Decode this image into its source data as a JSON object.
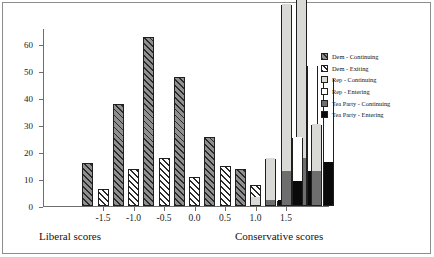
{
  "chart_data": {
    "type": "bar",
    "title": "",
    "subtitle": "",
    "xlabel_left": "Liberal scores",
    "xlabel_right": "Conservative scores",
    "ylabel": "",
    "ylim": [
      0,
      66
    ],
    "yticks": [
      0,
      10,
      20,
      30,
      40,
      50,
      60
    ],
    "ytick_labels": [
      "0",
      "10",
      "20",
      "30",
      "40",
      "50",
      "60"
    ],
    "xticks": [
      -1.5,
      -1.0,
      -0.5,
      0.0,
      0.5,
      1.0,
      1.5
    ],
    "xtick_labels": [
      "-1.5",
      "-1.0",
      "-0.5",
      "0.0",
      "0.5",
      "1.0",
      "1.5"
    ],
    "grid": false,
    "legend_position": "right",
    "stacked": true,
    "categories": [
      "-1.75",
      "-1.5",
      "-1.25",
      "-1.0",
      "-0.75",
      "-0.5",
      "-0.25",
      "0.0",
      "0.25",
      "0.5",
      "0.75",
      "1.0",
      "1.25",
      "1.5",
      "1.75"
    ],
    "series": [
      {
        "name": "Dem - Continuing",
        "color": "#8f8f8f",
        "pattern": "hatch-45-on-gray",
        "bars": [
          {
            "x": "-1.75",
            "value": 16
          },
          {
            "x": "-1.25",
            "value": 37.8
          },
          {
            "x": "-0.75",
            "value": 62.6
          },
          {
            "x": "-0.25",
            "value": 47.8
          },
          {
            "x": "0.25",
            "value": 25.7
          },
          {
            "x": "0.75",
            "value": 13.6
          },
          {
            "x": "1.25",
            "value": 0.8
          },
          {
            "x": "1.75",
            "value": 0.8
          }
        ]
      },
      {
        "name": "Dem - Exiting",
        "color": "#ffffff",
        "pattern": "hatch-45-on-white",
        "bars": [
          {
            "x": "-1.5",
            "value": 6.2
          },
          {
            "x": "-1.0",
            "value": 13.9
          },
          {
            "x": "-0.5",
            "value": 17.9
          },
          {
            "x": "0.0",
            "value": 10.8
          },
          {
            "x": "0.5",
            "value": 14.8
          },
          {
            "x": "1.0",
            "value": 7.7
          },
          {
            "x": "1.5",
            "value": 1.7
          }
        ]
      },
      {
        "name": "Rep - Continuing",
        "color": "#d9d9d6",
        "pattern": "solid-light-gray",
        "bars": [
          {
            "x": "1.0",
            "value": 2.9
          },
          {
            "x": "1.25",
            "value": 15.5
          },
          {
            "x": "1.5",
            "value": 61.8
          },
          {
            "x": "1.75",
            "value": 63.3
          },
          {
            "x": "2.0",
            "value": 17.5
          }
        ]
      },
      {
        "name": "Rep - Entering",
        "color": "#ffffff",
        "pattern": "solid-white",
        "bars": [
          {
            "x": "1.5",
            "value": 16.6
          },
          {
            "x": "1.75",
            "value": 39.5
          },
          {
            "x": "2.0",
            "value": 31.2
          }
        ]
      },
      {
        "name": "Tea Party - Continuing",
        "color": "#6e6e6e",
        "pattern": "solid-mid-gray",
        "bars": [
          {
            "x": "1.25",
            "value": 1.8
          },
          {
            "x": "1.5",
            "value": 12.6
          },
          {
            "x": "1.75",
            "value": 17.4
          },
          {
            "x": "2.0",
            "value": 12.5
          }
        ]
      },
      {
        "name": "Tea Party - Entering",
        "color": "#0a0a0a",
        "pattern": "solid-black",
        "bars": [
          {
            "x": "1.25",
            "value": 1.8
          },
          {
            "x": "1.5",
            "value": 8.8
          },
          {
            "x": "1.75",
            "value": 12.6
          },
          {
            "x": "2.0",
            "value": 15.8
          }
        ]
      }
    ]
  },
  "legend": {
    "items": [
      {
        "label": "Dem - Continuing",
        "swatch": "hatch-gray",
        "color": "#8f8f8f"
      },
      {
        "label": "Dem - Exiting",
        "swatch": "hatch-white",
        "color": "#ffffff"
      },
      {
        "label": "Rep - Continuing",
        "swatch": "light-gray",
        "color": "#d9d9d6"
      },
      {
        "label": "Rep - Entering",
        "swatch": "white",
        "color": "#ffffff"
      },
      {
        "label": "Tea Party - Continuing",
        "swatch": "mid-gray",
        "color": "#6e6e6e"
      },
      {
        "label": "Tea Party - Entering",
        "swatch": "black",
        "color": "#0a0a0a"
      }
    ]
  },
  "axis_captions": {
    "left": "Liberal scores",
    "right": "Conservative scores"
  }
}
